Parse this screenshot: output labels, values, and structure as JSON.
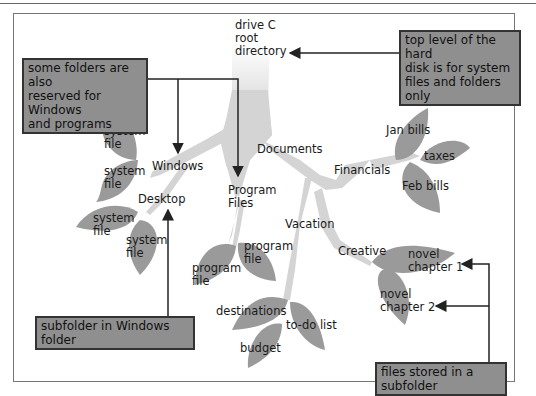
{
  "diagram": {
    "type": "folder-hierarchy-tree",
    "colors": {
      "trunk": "#d4d4d4",
      "leaf": "#9a9a9a",
      "callout_bg": "#8f8f8f",
      "callout_border": "#333333",
      "arrow": "#222222"
    },
    "root": {
      "label_line1": "drive C",
      "label_line2": "root",
      "label_line3": "directory"
    },
    "folders": {
      "windows": "Windows",
      "desktop": "Desktop",
      "program_files_line1": "Program",
      "program_files_line2": "Files",
      "documents": "Documents",
      "financials": "Financials",
      "vacation": "Vacation",
      "creative": "Creative"
    },
    "files": {
      "system_file_1": [
        "system",
        "file"
      ],
      "system_file_2": [
        "system",
        "file"
      ],
      "system_file_3": [
        "system",
        "file"
      ],
      "system_file_4": [
        "system",
        "file"
      ],
      "program_file_1": [
        "program",
        "file"
      ],
      "program_file_2": [
        "program",
        "file"
      ],
      "jan_bills": "Jan bills",
      "taxes": "taxes",
      "feb_bills": "Feb bills",
      "destinations": "destinations",
      "budget": "budget",
      "todo": "to-do list",
      "novel_1": [
        "novel",
        "chapter 1"
      ],
      "novel_2": [
        "novel",
        "chapter 2"
      ]
    },
    "callouts": {
      "reserved": [
        "some folders are also",
        "reserved for Windows",
        "and programs"
      ],
      "top_level": [
        "top level of the hard",
        "disk is for system",
        "files and folders only"
      ],
      "subfolder": "subfolder in Windows folder",
      "files_stored": "files stored in a subfolder"
    }
  }
}
